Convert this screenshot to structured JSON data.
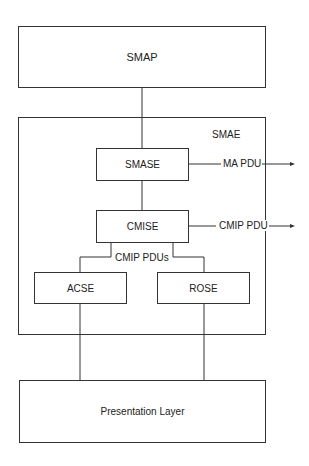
{
  "diagram": {
    "boxes": {
      "smap": "SMAP",
      "smae": "SMAE",
      "smase": "SMASE",
      "cmise": "CMISE",
      "acse": "ACSE",
      "rose": "ROSE",
      "presentation": "Presentation Layer"
    },
    "edge_labels": {
      "ma_pdu": "MA PDU",
      "cmip_pdu": "CMIP PDU",
      "cmip_pdus": "CMIP PDUs"
    }
  }
}
